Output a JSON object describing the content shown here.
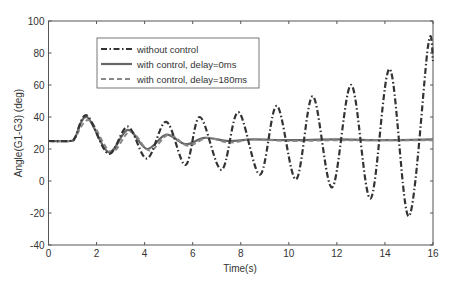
{
  "chart_data": {
    "type": "line",
    "title": "",
    "xlabel": "Time(s)",
    "ylabel": "Angle(G1-G3) (deg)",
    "xlim": [
      0,
      16
    ],
    "ylim": [
      -40,
      100
    ],
    "xticks": [
      0,
      2,
      4,
      6,
      8,
      10,
      12,
      14,
      16
    ],
    "yticks": [
      -40,
      -20,
      0,
      20,
      40,
      60,
      80,
      100
    ],
    "grid": false,
    "legend_position": "upper left",
    "series": [
      {
        "name": "without control",
        "style": "dash-dot",
        "x": [
          0,
          0.9,
          1.1,
          1.6,
          2.5,
          3.3,
          4.1,
          4.9,
          5.7,
          6.3,
          7.2,
          7.9,
          8.8,
          9.5,
          10.3,
          11.0,
          11.8,
          12.6,
          13.4,
          14.2,
          15.0,
          15.8,
          16.0
        ],
        "values": [
          25,
          25,
          27,
          41,
          17,
          34,
          14,
          37,
          10,
          40,
          7,
          43,
          4,
          47,
          1,
          53,
          -4,
          60,
          -11,
          70,
          -22,
          85,
          75
        ]
      },
      {
        "name": "with control, delay=0ms",
        "style": "solid",
        "x": [
          0,
          0.9,
          1.1,
          1.6,
          2.5,
          3.3,
          4.1,
          4.9,
          5.7,
          6.5,
          7.5,
          8.5,
          10,
          12,
          14,
          16
        ],
        "values": [
          25,
          25,
          27,
          40,
          18,
          32,
          20,
          29,
          23,
          27,
          25,
          26,
          25.5,
          26,
          25.5,
          26
        ]
      },
      {
        "name": "with control, delay=180ms",
        "style": "dashed",
        "x": [
          0,
          0.9,
          1.1,
          1.7,
          2.6,
          3.4,
          4.2,
          5.0,
          5.8,
          6.6,
          7.5,
          8.5,
          10,
          12,
          14,
          16
        ],
        "values": [
          25,
          25,
          27,
          38,
          18,
          31,
          19,
          29,
          22,
          27,
          24,
          26,
          25,
          25.5,
          25.5,
          25.5
        ]
      }
    ]
  },
  "legend": {
    "items": [
      "without control",
      "with control, delay=0ms",
      "with control, delay=180ms"
    ]
  },
  "axes": {
    "xlabel": "Time(s)",
    "ylabel": "Angle(G1-G3) (deg)"
  }
}
